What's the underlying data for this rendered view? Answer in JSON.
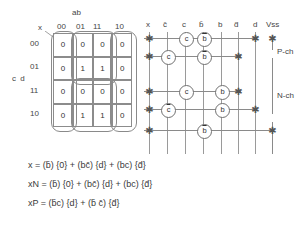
{
  "kmap": {
    "top_label": "ab",
    "side_label": "c d",
    "corner_label": "x",
    "col_headers": [
      "00",
      "01",
      "11",
      "10"
    ],
    "row_headers": [
      "00",
      "01",
      "11",
      "10"
    ],
    "cells": [
      [
        "0",
        "0",
        "0",
        "0"
      ],
      [
        "0",
        "1",
        "1",
        "0"
      ],
      [
        "0",
        "0",
        "0",
        "0"
      ],
      [
        "0",
        "1",
        "1",
        "0"
      ]
    ],
    "groups": [
      {
        "name": "group-col-00"
      },
      {
        "name": "group-col-10"
      },
      {
        "name": "group-top-middle"
      },
      {
        "name": "group-bottom-middle"
      }
    ]
  },
  "schematic": {
    "column_headers": [
      "x",
      "c̄",
      "c",
      "b̄",
      "b",
      "d̄",
      "d",
      "Vss"
    ],
    "region_labels": [
      "P-ch",
      "N-ch"
    ],
    "transistors": [
      {
        "label": "c",
        "bar": false,
        "row": 1,
        "col": 2
      },
      {
        "label": "b",
        "bar": true,
        "row": 1,
        "col": 3
      },
      {
        "label": "c",
        "bar": false,
        "row": 2,
        "col": 1
      },
      {
        "label": "b",
        "bar": true,
        "row": 2,
        "col": 3
      },
      {
        "label": "c",
        "bar": false,
        "row": 3,
        "col": 2
      },
      {
        "label": "b",
        "bar": false,
        "row": 3,
        "col": 4
      },
      {
        "label": "c",
        "bar": true,
        "row": 4,
        "col": 1
      },
      {
        "label": "b",
        "bar": false,
        "row": 4,
        "col": 4
      },
      {
        "label": "b",
        "bar": true,
        "row": 5,
        "col": 3
      }
    ]
  },
  "equations": {
    "line1": {
      "lhs": "x",
      "terms": "= (b̄) {0} + (bc̄) {d} + (bc) {d̄}"
    },
    "line2": {
      "lhs": "xN",
      "terms": "= (b̄) {0} + (bc̄) {d} + (bc) {d̄}"
    },
    "line3": {
      "lhs": "xP",
      "terms": "= (b̄c) {d} + (b̄ c̄) {d̄}"
    }
  }
}
